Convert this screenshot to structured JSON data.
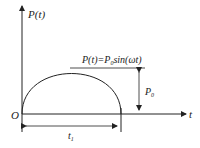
{
  "diagram": {
    "y_axis_label": "P(t)",
    "x_axis_label": "t",
    "origin_label": "O",
    "curve_label": "P(t)=P",
    "curve_label_sub": "0",
    "curve_label_tail": "sin(ωt)",
    "amplitude_label": "P",
    "amplitude_label_sub": "0",
    "duration_label": "t",
    "duration_label_sub": "1",
    "stroke_color": "#222222",
    "background": "#ffffff"
  }
}
